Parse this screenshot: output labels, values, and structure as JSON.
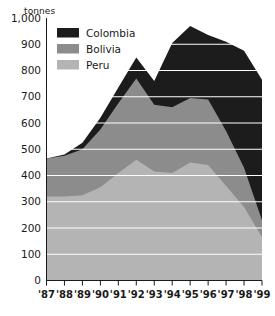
{
  "chart_data": {
    "type": "area",
    "stacked": true,
    "title": "",
    "subtitle": "",
    "xlabel": "",
    "ylabel": "tonnes",
    "unit_label": "tonnes",
    "grid": true,
    "legend_position": "top-left-inside",
    "ylim": [
      0,
      1000
    ],
    "ytick_step": 100,
    "ytick_labels": [
      "1,000",
      "900",
      "800",
      "700",
      "600",
      "500",
      "400",
      "300",
      "200",
      "100",
      "0"
    ],
    "ytick_values": [
      1000,
      900,
      800,
      700,
      600,
      500,
      400,
      300,
      200,
      100,
      0
    ],
    "categories": [
      "'87",
      "'88",
      "'89",
      "'90",
      "'91",
      "'92",
      "'93",
      "'94",
      "'95",
      "'96",
      "'97",
      "'98",
      "'99"
    ],
    "x": [
      1987,
      1988,
      1989,
      1990,
      1991,
      1992,
      1993,
      1994,
      1995,
      1996,
      1997,
      1998,
      1999
    ],
    "series": [
      {
        "name": "Peru",
        "color": "#b4b4b4",
        "values": [
          320,
          320,
          325,
          355,
          410,
          460,
          415,
          410,
          450,
          440,
          360,
          280,
          165
        ]
      },
      {
        "name": "Bolivia",
        "color": "#8c8c8c",
        "values": [
          145,
          155,
          175,
          220,
          265,
          310,
          255,
          250,
          245,
          250,
          210,
          150,
          65
        ]
      },
      {
        "name": "Colombia",
        "color": "#1c1c1c",
        "values": [
          0,
          5,
          25,
          45,
          60,
          80,
          90,
          245,
          275,
          245,
          340,
          445,
          535
        ]
      }
    ],
    "cumulative_tops": {
      "peru": [
        320,
        320,
        325,
        355,
        410,
        460,
        415,
        410,
        450,
        440,
        360,
        280,
        165
      ],
      "bolivia": [
        465,
        475,
        500,
        575,
        675,
        770,
        670,
        660,
        695,
        690,
        570,
        430,
        230
      ],
      "colombia": [
        465,
        480,
        525,
        620,
        735,
        850,
        760,
        905,
        970,
        935,
        910,
        875,
        765
      ]
    },
    "totals": [
      465,
      480,
      525,
      620,
      735,
      850,
      760,
      905,
      970,
      935,
      910,
      875,
      765
    ],
    "legend": [
      {
        "label": "Colombia",
        "color": "#1c1c1c"
      },
      {
        "label": "Bolivia",
        "color": "#8c8c8c"
      },
      {
        "label": "Peru",
        "color": "#b4b4b4"
      }
    ]
  }
}
